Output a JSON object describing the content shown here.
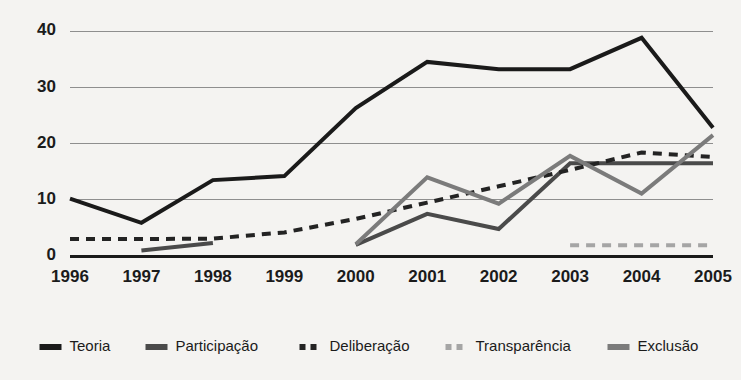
{
  "chart_data": {
    "type": "line",
    "title": "",
    "subtitle": "",
    "xlabel": "",
    "ylabel": "",
    "categories": [
      "1996",
      "1997",
      "1998",
      "1999",
      "2000",
      "2001",
      "2002",
      "2003",
      "2004",
      "2005"
    ],
    "x": [
      1996,
      1997,
      1998,
      1999,
      2000,
      2001,
      2002,
      2003,
      2004,
      2005
    ],
    "ylim": [
      0,
      40
    ],
    "yticks": [
      0,
      10,
      20,
      30,
      40
    ],
    "ytick_labels": [
      "0",
      "10",
      "20",
      "30",
      "40"
    ],
    "grid": true,
    "grid_axis": "y",
    "legend_position": "bottom",
    "series": [
      {
        "name": "Teoria",
        "color": "#1a1a1a",
        "style": "solid",
        "width": 4,
        "values": [
          10.2,
          5.9,
          13.5,
          14.2,
          26.3,
          34.5,
          33.2,
          33.2,
          38.8,
          22.8
        ]
      },
      {
        "name": "Participação",
        "color": "#4a4a4a",
        "style": "solid",
        "width": 4,
        "values": [
          null,
          1.0,
          2.3,
          null,
          2.0,
          7.5,
          4.8,
          16.5,
          16.5,
          16.5
        ]
      },
      {
        "name": "Deliberação",
        "color": "#232323",
        "style": "dashed",
        "width": 4,
        "values": [
          3.0,
          3.0,
          3.1,
          4.2,
          6.6,
          9.5,
          12.4,
          15.3,
          18.4,
          17.6
        ]
      },
      {
        "name": "Transparência",
        "color": "#a5a5a5",
        "style": "dashed",
        "width": 4,
        "values": [
          null,
          null,
          null,
          null,
          null,
          null,
          null,
          1.9,
          1.9,
          1.9
        ]
      },
      {
        "name": "Exclusão",
        "color": "#7b7b7b",
        "style": "solid",
        "width": 4,
        "values": [
          null,
          null,
          null,
          null,
          2.1,
          14.0,
          9.3,
          17.8,
          11.1,
          21.5
        ]
      }
    ]
  },
  "axes": {
    "y_tick_labels": [
      "40",
      "30",
      "20",
      "10",
      "0"
    ],
    "x_tick_labels": [
      "1996",
      "1997",
      "1998",
      "1999",
      "2000",
      "2001",
      "2002",
      "2003",
      "2004",
      "2005"
    ]
  },
  "legend": {
    "entries": [
      {
        "label": "Teoria",
        "color": "#1a1a1a",
        "style": "solid"
      },
      {
        "label": "Participação",
        "color": "#4a4a4a",
        "style": "solid"
      },
      {
        "label": "Deliberação",
        "color": "#232323",
        "style": "dashed"
      },
      {
        "label": "Transparência",
        "color": "#a5a5a5",
        "style": "dashed"
      },
      {
        "label": "Exclusão",
        "color": "#7b7b7b",
        "style": "solid"
      }
    ]
  },
  "colors": {
    "background": "#f4f3f1",
    "gridline": "#8e8e8e",
    "baseline": "#1a1a1a",
    "text": "#1b1b1b"
  }
}
